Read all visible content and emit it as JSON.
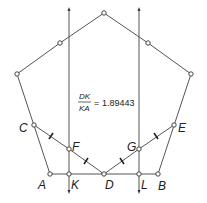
{
  "diagram": {
    "type": "geometry-construction",
    "shape": "pentagon",
    "measurement": {
      "numerator": "DK",
      "denominator": "KA",
      "equals": "=",
      "value": "1.89443"
    },
    "labels": {
      "A": "A",
      "B": "B",
      "C": "C",
      "D": "D",
      "E": "E",
      "F": "F",
      "G": "G",
      "K": "K",
      "L": "L"
    },
    "points": {
      "top": [
        104,
        13
      ],
      "upper_left_mid": [
        60,
        43
      ],
      "upper_right_mid": [
        148,
        43
      ],
      "left": [
        17,
        74
      ],
      "right": [
        191,
        74
      ],
      "C": [
        34,
        125
      ],
      "E": [
        174,
        125
      ],
      "F": [
        69,
        149
      ],
      "G": [
        139,
        149
      ],
      "A": [
        50,
        174
      ],
      "K": [
        69,
        174
      ],
      "D": [
        104,
        174
      ],
      "L": [
        139,
        174
      ],
      "B": [
        158,
        174
      ]
    },
    "vertical_lines_x": [
      69,
      139
    ],
    "colors": {
      "line": "#555555",
      "text": "#222222",
      "background": "#ffffff"
    }
  }
}
